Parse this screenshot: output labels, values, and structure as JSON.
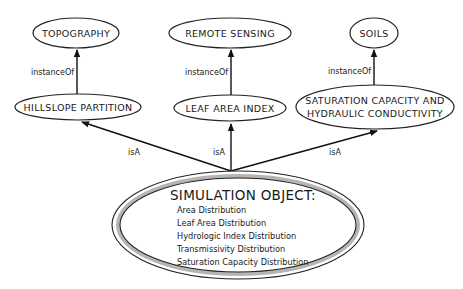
{
  "diagram": {
    "nodes": {
      "topography": "TOPOGRAPHY",
      "remote_sensing": "REMOTE SENSING",
      "soils": "SOILS",
      "hillslope_partition": "HILLSLOPE PARTITION",
      "leaf_area_index": "LEAF AREA INDEX",
      "saturation_line1": "SATURATION CAPACITY AND",
      "saturation_line2": "HYDRAULIC CONDUCTIVITY"
    },
    "simulation_object": {
      "title": "SIMULATION OBJECT:",
      "attributes": [
        "Area Distribution",
        "Leaf Area Distribution",
        "Hydrologic Index Distribution",
        "Transmissivity Distribution",
        "Saturation Capacity Distribution"
      ]
    },
    "edges": [
      {
        "from": "hillslope_partition",
        "to": "topography",
        "label": "instanceOf"
      },
      {
        "from": "leaf_area_index",
        "to": "remote_sensing",
        "label": "instanceOf"
      },
      {
        "from": "saturation_capacity",
        "to": "soils",
        "label": "instanceOf"
      },
      {
        "from": "simulation_object",
        "to": "hillslope_partition",
        "label": "isA"
      },
      {
        "from": "simulation_object",
        "to": "leaf_area_index",
        "label": "isA"
      },
      {
        "from": "simulation_object",
        "to": "saturation_capacity",
        "label": "isA"
      }
    ]
  }
}
